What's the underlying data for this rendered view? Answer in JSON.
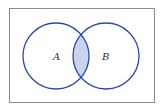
{
  "diagram": {
    "type": "venn",
    "universe": {
      "x": 9,
      "y": 8,
      "width": 145,
      "height": 95,
      "stroke": "#8a8a8a"
    },
    "sets": [
      {
        "label": "A",
        "cx": 56,
        "cy": 56,
        "r": 33,
        "stroke": "#2f48a8"
      },
      {
        "label": "B",
        "cx": 106,
        "cy": 56,
        "r": 33,
        "stroke": "#2f48a8"
      }
    ],
    "shaded_region": "A ∩ B",
    "shade_color": "#c8d4ee"
  }
}
